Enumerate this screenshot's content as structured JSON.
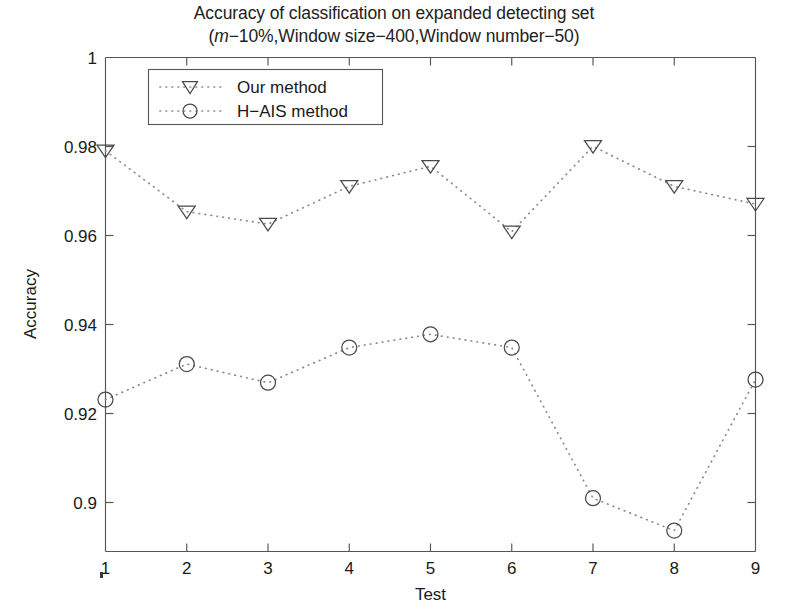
{
  "figure": {
    "title_line1": "Accuracy of classification on expanded detecting set",
    "title_line2_prefix": "(",
    "title_line2_italic": "m",
    "title_line2_suffix": "−10%,Window size−400,Window number−50)"
  },
  "chart_data": {
    "type": "line",
    "title": "Accuracy of classification on expanded detecting set (m−10%,Window size−400,Window number−50)",
    "xlabel": "Test",
    "ylabel": "Accuracy",
    "x": [
      1,
      2,
      3,
      4,
      5,
      6,
      7,
      8,
      9
    ],
    "categories": [
      "1",
      "2",
      "3",
      "4",
      "5",
      "6",
      "7",
      "8",
      "9"
    ],
    "xlim": [
      1,
      9
    ],
    "ylim": [
      0.8888,
      1.0
    ],
    "xticks": [
      "1",
      "2",
      "3",
      "4",
      "5",
      "6",
      "7",
      "8",
      "9"
    ],
    "yticks": [
      "1",
      "0.98",
      "0.96",
      "0.94",
      "0.92",
      "0.9"
    ],
    "ytick_values": [
      1,
      0.98,
      0.96,
      0.94,
      0.92,
      0.9
    ],
    "grid": false,
    "legend_position": "upper-left-inside",
    "series": [
      {
        "name": "Our method",
        "marker": "triangle-down",
        "linestyle": "dotted",
        "color": "#4a4a4a",
        "values": [
          0.979,
          0.9653,
          0.9625,
          0.971,
          0.9755,
          0.9608,
          0.98,
          0.971,
          0.967
        ]
      },
      {
        "name": "H−AIS method",
        "marker": "circle",
        "linestyle": "dotted",
        "color": "#4a4a4a",
        "values": [
          0.923,
          0.931,
          0.9268,
          0.9347,
          0.9377,
          0.9347,
          0.9008,
          0.8935,
          0.9275
        ]
      }
    ]
  },
  "legend": {
    "items": [
      {
        "label": "Our method",
        "marker": "triangle-down-icon"
      },
      {
        "label": "H−AIS method",
        "marker": "circle-icon"
      }
    ]
  }
}
